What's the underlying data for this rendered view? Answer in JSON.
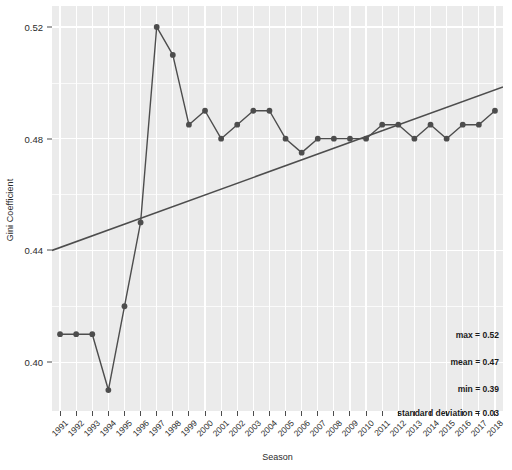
{
  "chart_data": {
    "type": "line",
    "title": "",
    "subtitle": "",
    "xlabel": "Season",
    "ylabel": "Gini Coefficient",
    "x": [
      "1991",
      "1992",
      "1993",
      "1994",
      "1995",
      "1996",
      "1997",
      "1998",
      "1999",
      "2000",
      "2001",
      "2002",
      "2003",
      "2004",
      "2005",
      "2006",
      "2007",
      "2008",
      "2009",
      "2010",
      "2011",
      "2012",
      "2013",
      "2014",
      "2015",
      "2016",
      "2017",
      "2018"
    ],
    "categories": [
      "1991",
      "1992",
      "1993",
      "1994",
      "1995",
      "1996",
      "1997",
      "1998",
      "1999",
      "2000",
      "2001",
      "2002",
      "2003",
      "2004",
      "2005",
      "2006",
      "2007",
      "2008",
      "2009",
      "2010",
      "2011",
      "2012",
      "2013",
      "2014",
      "2015",
      "2016",
      "2017",
      "2018"
    ],
    "series": [
      {
        "name": "Gini Coefficient",
        "type": "line",
        "marker": "circle",
        "color": "#4d4d4d",
        "values": [
          0.41,
          0.41,
          0.41,
          0.39,
          0.42,
          0.45,
          0.52,
          0.51,
          0.485,
          0.49,
          0.48,
          0.485,
          0.49,
          0.49,
          0.48,
          0.475,
          0.48,
          0.48,
          0.48,
          0.48,
          0.485,
          0.485,
          0.48,
          0.485,
          0.48,
          0.485,
          0.485,
          0.49
        ]
      },
      {
        "name": "Trend",
        "type": "trendline",
        "color": "#4d4d4d",
        "start": 0.44,
        "end": 0.4985
      }
    ],
    "ylim": [
      0.3825,
      0.5275
    ],
    "y_ticks": [
      0.4,
      0.44,
      0.48,
      0.52
    ],
    "y_tick_labels": [
      "0.40",
      "0.44",
      "0.48",
      "0.52"
    ],
    "y_minor_ticks": [
      0.42,
      0.46,
      0.5
    ],
    "grid": true,
    "legend": "none",
    "panel_background": "#ebebeb",
    "grid_color": "#ffffff",
    "annotations": [
      {
        "text": "max = 0.52",
        "value": 0.52
      },
      {
        "text": "mean = 0.47",
        "value": 0.47
      },
      {
        "text": "min = 0.39",
        "value": 0.39
      },
      {
        "text": "standard deviation = 0.03",
        "value": 0.03
      }
    ]
  }
}
